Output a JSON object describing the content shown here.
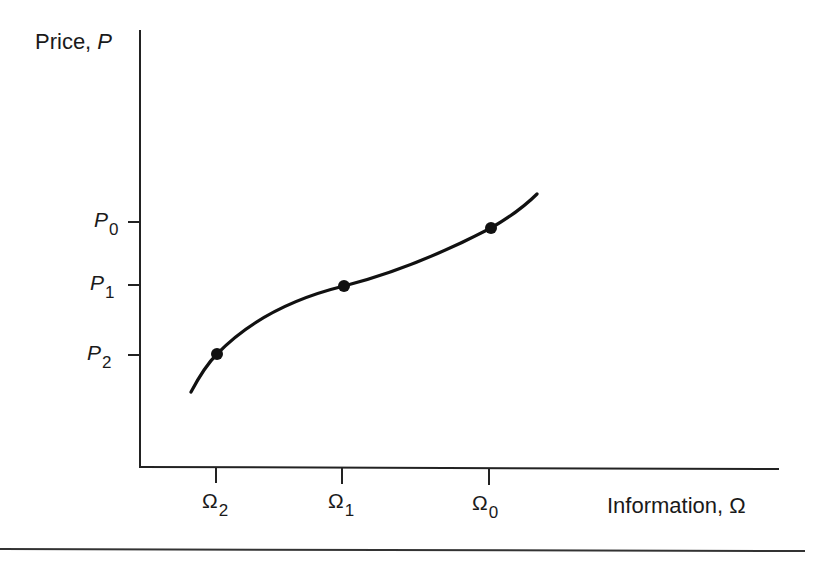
{
  "figure": {
    "y_axis_label": {
      "text": "Price, ",
      "symbol": "P"
    },
    "x_axis_label": {
      "text": "Information, ",
      "symbol": "Ω"
    },
    "y_ticks": [
      {
        "symbol": "P",
        "subscript": "0"
      },
      {
        "symbol": "P",
        "subscript": "1"
      },
      {
        "symbol": "P",
        "subscript": "2"
      }
    ],
    "x_ticks": [
      {
        "symbol": "Ω",
        "subscript": "2"
      },
      {
        "symbol": "Ω",
        "subscript": "1"
      },
      {
        "symbol": "Ω",
        "subscript": "0"
      }
    ],
    "points": [
      {
        "label": "(Ω2, P2)"
      },
      {
        "label": "(Ω1, P1)"
      },
      {
        "label": "(Ω0, P0)"
      }
    ],
    "line_color": "#111111"
  }
}
